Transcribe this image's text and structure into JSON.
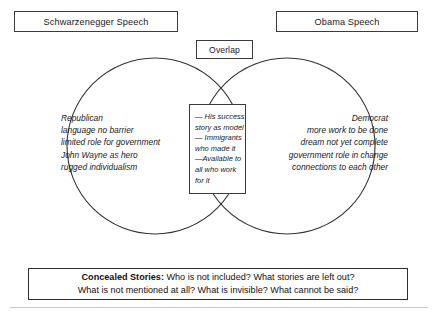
{
  "diagram": {
    "type": "venn",
    "left_title": "Schwarzenegger Speech",
    "right_title": "Obama Speech",
    "overlap_title": "Overlap",
    "left_circle_text": "Republican\nlanguage no barrier\nlimited role for government\nJohn Wayne as hero\nrugged individualism",
    "right_circle_text": "Democrat\nmore work to be done\ndream not yet complete\ngovernment role in change\nconnections to each other",
    "overlap_text": "— His success\nstory as model\n— Immigrants\nwho made it\n—Available to\nall who work\nfor it",
    "circle_stroke_color": "#333333",
    "box_stroke_color": "#3b3b3b",
    "background_color": "#ffffff"
  },
  "concealed": {
    "lead": "Concealed Stories:",
    "line1": " Who is not included? What stories are left out?",
    "line2": "What is not mentioned at all? What is invisible? What cannot be said?"
  }
}
